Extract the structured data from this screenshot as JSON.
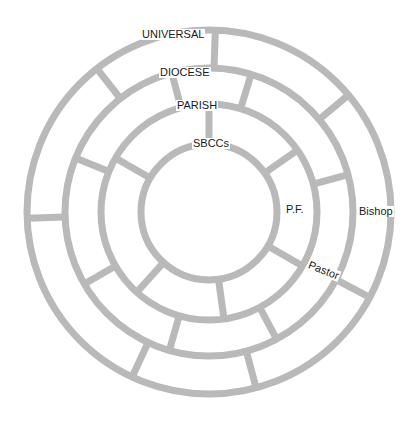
{
  "diagram": {
    "type": "concentric-rings",
    "center": [
      209,
      212
    ],
    "colors": {
      "stroke": "#b9b9b9",
      "text": "#1a1a1a",
      "background": "#ffffff"
    },
    "rings": [
      {
        "name": "universal",
        "label": "UNIVERSAL",
        "radius": 182
      },
      {
        "name": "diocese",
        "label": "DIOCESE",
        "radius": 144
      },
      {
        "name": "parish",
        "label": "PARISH",
        "radius": 108
      },
      {
        "name": "sbccs",
        "label": "SBCCs",
        "radius": 68
      }
    ],
    "side_labels": [
      {
        "name": "bishop",
        "label": "Bishop"
      },
      {
        "name": "pastor",
        "label": "Pastor"
      },
      {
        "name": "pf",
        "label": "P.F."
      }
    ],
    "spokes": [
      {
        "band": "universal-diocese",
        "angles": [
          2,
          50,
          118,
          165,
          205,
          268,
          322
        ]
      },
      {
        "band": "diocese-parish",
        "angles": [
          17,
          75,
          152,
          196,
          240,
          292,
          345
        ]
      },
      {
        "band": "parish-sbccs",
        "angles": [
          0,
          55,
          120,
          172,
          222,
          300
        ]
      }
    ]
  }
}
